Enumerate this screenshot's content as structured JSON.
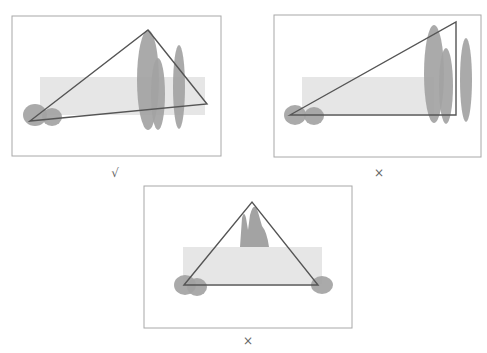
{
  "colors": {
    "frame": "#a8a8a8",
    "band": "#e6e6e6",
    "blob": "#a3a3a3",
    "line": "#555555",
    "mark": "#666666"
  },
  "panels": [
    {
      "id": "a",
      "verdict": "correct",
      "mark": "√",
      "frame": {
        "x": 12,
        "y": 16,
        "w": 209,
        "h": 140
      },
      "band": {
        "x": 40,
        "y": 77,
        "w": 165,
        "h": 38
      },
      "blobs": [
        {
          "cx": 35,
          "cy": 115,
          "rx": 12,
          "ry": 11
        },
        {
          "cx": 52,
          "cy": 117,
          "rx": 10,
          "ry": 9
        },
        {
          "cx": 148,
          "cy": 80,
          "rx": 11,
          "ry": 50
        },
        {
          "cx": 158,
          "cy": 94,
          "rx": 7,
          "ry": 36
        },
        {
          "cx": 179,
          "cy": 87,
          "rx": 6,
          "ry": 42
        }
      ],
      "triangle": [
        [
          30,
          121
        ],
        [
          148,
          30
        ],
        [
          207,
          104
        ]
      ],
      "mark_pos": {
        "x": 105,
        "y": 166
      }
    },
    {
      "id": "b",
      "verdict": "incorrect",
      "mark": "×",
      "frame": {
        "x": 274,
        "y": 15,
        "w": 207,
        "h": 142
      },
      "band": {
        "x": 302,
        "y": 77,
        "w": 132,
        "h": 37
      },
      "blobs": [
        {
          "cx": 295,
          "cy": 115,
          "rx": 11,
          "ry": 10
        },
        {
          "cx": 314,
          "cy": 116,
          "rx": 10,
          "ry": 9
        },
        {
          "cx": 434,
          "cy": 74,
          "rx": 10,
          "ry": 49
        },
        {
          "cx": 446,
          "cy": 86,
          "rx": 7,
          "ry": 38
        },
        {
          "cx": 466,
          "cy": 80,
          "rx": 6,
          "ry": 42
        }
      ],
      "triangle": [
        [
          290,
          115
        ],
        [
          456,
          22
        ],
        [
          456,
          115
        ]
      ],
      "mark_pos": {
        "x": 369,
        "y": 166
      }
    },
    {
      "id": "c",
      "verdict": "incorrect",
      "mark": "×",
      "frame": {
        "x": 144,
        "y": 186,
        "w": 208,
        "h": 142
      },
      "band": {
        "x": 183,
        "y": 247,
        "w": 139,
        "h": 37
      },
      "blobs": [
        {
          "cx": 185,
          "cy": 285,
          "rx": 11,
          "ry": 10
        },
        {
          "cx": 197,
          "cy": 287,
          "rx": 10,
          "ry": 9
        },
        {
          "cx": 322,
          "cy": 285,
          "rx": 11,
          "ry": 9
        }
      ],
      "peaks": "M 240 247 L 242 218 Q 244 210 246 218 L 248 230 L 250 215 Q 254 200 258 212 L 262 226 Q 267 232 269 247 Z",
      "triangle": [
        [
          184,
          285
        ],
        [
          252,
          202
        ],
        [
          318,
          285
        ]
      ],
      "mark_pos": {
        "x": 238,
        "y": 334
      }
    }
  ]
}
